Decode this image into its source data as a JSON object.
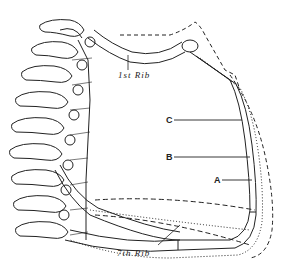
{
  "figure": {
    "labels": {
      "first_rib": "1st Rib",
      "seventh_rib": "7th Rib",
      "position_c": "C",
      "position_b": "B",
      "position_a": "A"
    },
    "line_styles": {
      "A": "solid",
      "B": "dotted",
      "C": "dashed"
    },
    "colors": {
      "ink": "#222222",
      "background": "#ffffff"
    }
  }
}
